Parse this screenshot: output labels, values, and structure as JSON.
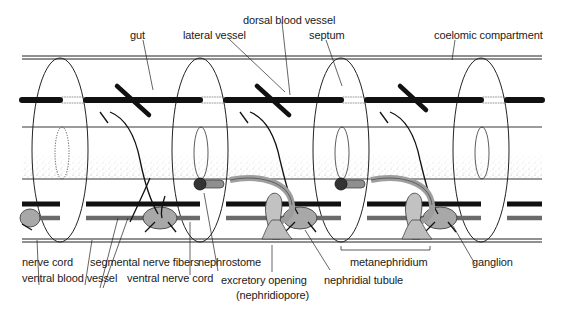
{
  "figure": {
    "colors": {
      "ink": "#1a1a1a",
      "vessel": "#111111",
      "nerve_cord": "#6a6a6a",
      "stipple": "#9a9a9a",
      "nephridium_fill": "#bdbdbd",
      "background": "#ffffff"
    },
    "labels": {
      "dorsal_blood_vessel": "dorsal blood vessel",
      "gut": "gut",
      "lateral_vessel": "lateral vessel",
      "septum": "septum",
      "coelomic_compartment": "coelomic compartment",
      "nerve_cord": "nerve cord",
      "ventral_blood_vessel": "ventral blood vessel",
      "segmental_nerve_fibers": "segmental nerve fibers",
      "ventral_nerve_cord": "ventral nerve cord",
      "nephrostome": "nephrostome",
      "excretory_opening": "excretory opening",
      "nephridiopore": "(nephridiopore)",
      "nephridial_tubule": "nephridial tubule",
      "metanephridium": "metanephridium",
      "ganglion": "ganglion"
    }
  }
}
